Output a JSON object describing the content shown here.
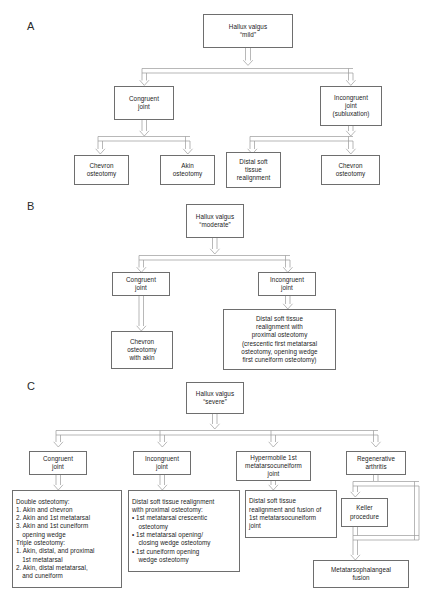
{
  "figure": {
    "type": "clinical-algorithm-flowchart",
    "panel_letters": {
      "a": "A",
      "b": "B",
      "c": "C"
    }
  },
  "panel_a": {
    "letter": "A",
    "root": "Hallux valgus\n\"mild\"",
    "root_line1": "Hallux valgus",
    "root_line2": "“mild”",
    "branch_left_line1": "Congruent",
    "branch_left_line2": "joint",
    "branch_right_line1": "Incongruent",
    "branch_right_line2": "joint",
    "branch_right_line3": "(subluxation)",
    "leaf1_line1": "Chevron",
    "leaf1_line2": "osteotomy",
    "leaf2_line1": "Akin",
    "leaf2_line2": "osteotomy",
    "leaf3_line1": "Distal soft",
    "leaf3_line2": "tissue",
    "leaf3_line3": "realignment",
    "leaf4_line1": "Chevron",
    "leaf4_line2": "osteotomy"
  },
  "panel_b": {
    "letter": "B",
    "root_line1": "Hallux valgus",
    "root_line2": "“moderate”",
    "branch_left_line1": "Congruent",
    "branch_left_line2": "joint",
    "branch_right_line1": "Incongruent",
    "branch_right_line2": "joint",
    "leaf_left_line1": "Chevron",
    "leaf_left_line2": "osteotomy",
    "leaf_left_line3": "with akin",
    "leaf_right_line1": "Distal soft tissue",
    "leaf_right_line2": "realignment with",
    "leaf_right_line3": "proximal osteotomy",
    "leaf_right_line4": "(crescentic first metatarsal",
    "leaf_right_line5": "osteotomy, opening wedge",
    "leaf_right_line6": "first cuneiform osteotomy)"
  },
  "panel_c": {
    "letter": "C",
    "root_line1": "Hallux valgus",
    "root_line2": "“severe”",
    "branch1_line1": "Congruent",
    "branch1_line2": "joint",
    "branch2_line1": "Incongruent",
    "branch2_line2": "joint",
    "branch3_line1": "Hypermobile 1st",
    "branch3_line2": "metatarsocuneiform",
    "branch3_line3": "joint",
    "branch4_line1": "Regenerative",
    "branch4_line2": "arthritis",
    "leaf1": [
      "Double osteotomy:",
      "1. Akin and chevron",
      "2. Akin and 1st metatarsal",
      "3. Akin and 1st cuneiform",
      "opening wedge",
      "Triple osteotomy:",
      "1. Akin, distal, and proximal",
      "1st metatarsal",
      "2. Akin, distal metatarsal,",
      "and cuneiform"
    ],
    "leaf2": [
      "Distal soft tissue realignment",
      "with proximal osteotomy:",
      "• 1st metatarsal crescentic",
      "osteotomy",
      "• 1st metatarsal opening/",
      "closing wedge osteotomy",
      "• 1st cuneiform opening",
      "wedge osteotomy"
    ],
    "leaf3": [
      "Distal soft tissue",
      "realignment and fusion of",
      "1st metatarsocuneiform",
      "joint"
    ],
    "leaf4_line1": "Keller",
    "leaf4_line2": "procedure",
    "leaf5_line1": "Metatarsophalangeal",
    "leaf5_line2": "fusion"
  },
  "style": {
    "border_color": "#6e6e6e",
    "arrow_color": "#8a8a8a",
    "text_color": "#1b1b1b",
    "background": "#ffffff"
  }
}
